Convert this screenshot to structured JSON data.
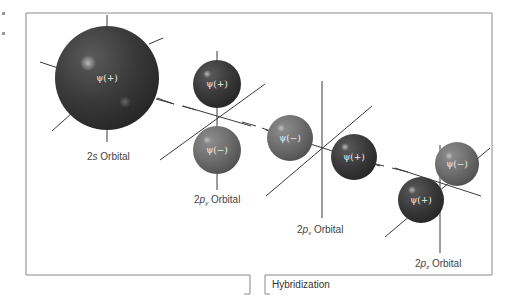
{
  "diagram": {
    "title_box_label": "Hybridization",
    "colors": {
      "frame": "#8a8a8a",
      "axis": "#3a3a3a",
      "positive_lobe": "#3a3a3a",
      "negative_lobe": "#6e6e6e",
      "lobe_text": "#eeeeee",
      "label_text": "#444444"
    },
    "orbitals": [
      {
        "id": "2s",
        "label_prefix": "2",
        "label_letter": "s",
        "label_sub": "",
        "label_suffix": " Orbital",
        "lobes": [
          {
            "sign": "+",
            "text": "ψ(+)",
            "cx": 107,
            "cy": 78,
            "r": 52
          }
        ]
      },
      {
        "id": "2py",
        "label_prefix": "2",
        "label_letter": "p",
        "label_sub": "y",
        "label_suffix": " Orbital",
        "lobes": [
          {
            "sign": "+",
            "text": "ψ(+)",
            "cx": 217,
            "cy": 84,
            "r": 24
          },
          {
            "sign": "-",
            "text": "ψ(−)",
            "cx": 217,
            "cy": 150,
            "r": 24
          }
        ]
      },
      {
        "id": "2px",
        "label_prefix": "2",
        "label_letter": "p",
        "label_sub": "x",
        "label_suffix": " Orbital",
        "lobes": [
          {
            "sign": "-",
            "text": "ψ(−)",
            "cx": 290,
            "cy": 138,
            "r": 23
          },
          {
            "sign": "+",
            "text": "ψ(+)",
            "cx": 354,
            "cy": 157,
            "r": 23
          }
        ]
      },
      {
        "id": "2pz",
        "label_prefix": "2",
        "label_letter": "p",
        "label_sub": "z",
        "label_suffix": " Orbital",
        "lobes": [
          {
            "sign": "-",
            "text": "ψ(−)",
            "cx": 457,
            "cy": 164,
            "r": 22
          },
          {
            "sign": "+",
            "text": "ψ(+)",
            "cx": 421,
            "cy": 200,
            "r": 23
          }
        ]
      }
    ]
  }
}
